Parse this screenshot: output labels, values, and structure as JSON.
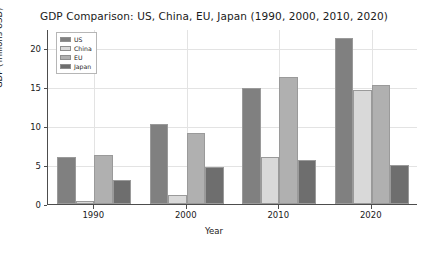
{
  "chart_data": {
    "type": "bar",
    "title": "GDP Comparison: US, China, EU, Japan (1990, 2000, 2010, 2020)",
    "xlabel": "Year",
    "ylabel": "GDP (Trillions USD)",
    "categories": [
      "1990",
      "2000",
      "2010",
      "2020"
    ],
    "series": [
      {
        "name": "US",
        "color": "#808080",
        "values": [
          6.0,
          10.3,
          14.9,
          21.4
        ]
      },
      {
        "name": "China",
        "color": "#d9d9d9",
        "values": [
          0.4,
          1.2,
          6.1,
          14.7
        ]
      },
      {
        "name": "EU",
        "color": "#b0b0b0",
        "values": [
          6.3,
          9.1,
          16.3,
          15.3
        ]
      },
      {
        "name": "Japan",
        "color": "#6e6e6e",
        "values": [
          3.1,
          4.8,
          5.7,
          5.0
        ]
      }
    ],
    "ylim": [
      0,
      22.5
    ],
    "yticks": [
      0,
      5,
      10,
      15,
      20
    ],
    "ytick_labels": [
      "0",
      "5",
      "10",
      "15",
      "20"
    ],
    "grid": true,
    "legend_position": "upper left"
  },
  "legend": {
    "entries": [
      "US",
      "China",
      "EU",
      "Japan"
    ]
  }
}
